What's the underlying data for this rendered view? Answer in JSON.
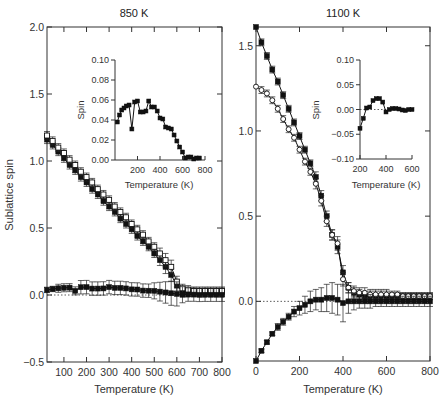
{
  "chart_data": [
    {
      "type": "line",
      "panel": "left",
      "title": "850 K",
      "xlabel": "Temperature (K)",
      "ylabel": "Sublattice spin",
      "xlim": [
        25,
        800
      ],
      "ylim": [
        -0.5,
        2.0
      ],
      "xticks": [
        100,
        200,
        300,
        400,
        500,
        600,
        700,
        800
      ],
      "yticks": [
        -0.5,
        0.0,
        0.5,
        1.0,
        1.5,
        2.0
      ],
      "ytick_labels": [
        "−0.5",
        "0.0",
        "0.5",
        "1.0",
        "1.5",
        "2.0"
      ],
      "grid": false,
      "zero_dotted_line": true,
      "series": [
        {
          "name": "sublattice A (filled)",
          "marker": "filled-square",
          "x": [
            25,
            50,
            75,
            100,
            125,
            150,
            175,
            200,
            225,
            250,
            275,
            300,
            325,
            350,
            375,
            400,
            425,
            450,
            475,
            500,
            525,
            550,
            575,
            600,
            625,
            650,
            675,
            700,
            725,
            750,
            775,
            800
          ],
          "y": [
            1.16,
            1.12,
            1.07,
            1.02,
            0.97,
            0.93,
            0.88,
            0.84,
            0.79,
            0.75,
            0.7,
            0.66,
            0.62,
            0.57,
            0.53,
            0.49,
            0.44,
            0.4,
            0.36,
            0.31,
            0.26,
            0.21,
            0.15,
            0.07,
            0.03,
            0.02,
            0.02,
            0.02,
            0.02,
            0.02,
            0.02,
            0.02
          ],
          "err": [
            0.03,
            0.03,
            0.03,
            0.03,
            0.03,
            0.03,
            0.03,
            0.03,
            0.03,
            0.03,
            0.03,
            0.03,
            0.03,
            0.03,
            0.03,
            0.03,
            0.03,
            0.03,
            0.03,
            0.03,
            0.04,
            0.05,
            0.05,
            0.04,
            0.03,
            0.03,
            0.03,
            0.03,
            0.03,
            0.03,
            0.03,
            0.03
          ]
        },
        {
          "name": "sublattice B (open)",
          "marker": "open-square",
          "x": [
            25,
            50,
            75,
            100,
            125,
            150,
            175,
            200,
            225,
            250,
            275,
            300,
            325,
            350,
            375,
            400,
            425,
            450,
            475,
            500,
            525,
            550,
            575,
            600,
            625,
            650,
            675,
            700,
            725,
            750,
            775,
            800
          ],
          "y": [
            1.19,
            1.15,
            1.1,
            1.06,
            1.01,
            0.97,
            0.92,
            0.88,
            0.84,
            0.79,
            0.75,
            0.71,
            0.66,
            0.62,
            0.58,
            0.53,
            0.49,
            0.45,
            0.4,
            0.36,
            0.31,
            0.26,
            0.21,
            0.1,
            0.05,
            0.04,
            0.03,
            0.03,
            0.03,
            0.03,
            0.03,
            0.03
          ],
          "err": [
            0.03,
            0.03,
            0.03,
            0.03,
            0.03,
            0.03,
            0.03,
            0.03,
            0.03,
            0.03,
            0.03,
            0.03,
            0.03,
            0.03,
            0.03,
            0.03,
            0.03,
            0.03,
            0.03,
            0.03,
            0.04,
            0.05,
            0.05,
            0.04,
            0.03,
            0.03,
            0.03,
            0.03,
            0.03,
            0.03,
            0.03,
            0.03
          ]
        },
        {
          "name": "net spin (filled)",
          "marker": "filled-square",
          "x": [
            25,
            50,
            75,
            100,
            125,
            150,
            175,
            200,
            225,
            250,
            275,
            300,
            325,
            350,
            375,
            400,
            425,
            450,
            475,
            500,
            525,
            550,
            575,
            600,
            625,
            650,
            675,
            700,
            725,
            750,
            775,
            800
          ],
          "y": [
            0.038,
            0.045,
            0.05,
            0.054,
            0.055,
            0.031,
            0.058,
            0.059,
            0.048,
            0.048,
            0.049,
            0.059,
            0.053,
            0.053,
            0.049,
            0.042,
            0.041,
            0.033,
            0.032,
            0.031,
            0.025,
            0.019,
            0.013,
            0.008,
            0.002,
            0.003,
            0.003,
            0.001,
            0.002,
            0.002,
            0.002,
            0.002
          ],
          "err": [
            0.02,
            0.02,
            0.03,
            0.03,
            0.03,
            0.03,
            0.05,
            0.05,
            0.05,
            0.05,
            0.05,
            0.05,
            0.05,
            0.05,
            0.05,
            0.05,
            0.05,
            0.05,
            0.05,
            0.06,
            0.07,
            0.08,
            0.09,
            0.09,
            0.06,
            0.05,
            0.05,
            0.05,
            0.05,
            0.05,
            0.05,
            0.05
          ]
        }
      ],
      "inset": {
        "xlabel": "Temperature (K)",
        "ylabel": "Spin",
        "xlim": [
          0,
          800
        ],
        "ylim": [
          0.0,
          0.1
        ],
        "xticks": [
          200,
          400,
          600,
          800
        ],
        "yticks": [
          0.0,
          0.02,
          0.04,
          0.06,
          0.08,
          0.1
        ],
        "ytick_labels": [
          "0.00",
          "0.02",
          "0.04",
          "0.06",
          "0.08",
          "0.10"
        ],
        "x": [
          20,
          40,
          60,
          80,
          100,
          125,
          150,
          175,
          200,
          225,
          250,
          275,
          300,
          325,
          350,
          375,
          400,
          425,
          450,
          475,
          500,
          525,
          550,
          575,
          600,
          625,
          650,
          675,
          700,
          725,
          750
        ],
        "y": [
          0.038,
          0.045,
          0.05,
          0.052,
          0.054,
          0.055,
          0.031,
          0.058,
          0.059,
          0.048,
          0.048,
          0.049,
          0.059,
          0.053,
          0.053,
          0.049,
          0.042,
          0.041,
          0.033,
          0.032,
          0.031,
          0.025,
          0.019,
          0.013,
          0.008,
          0.002,
          0.003,
          0.003,
          0.001,
          0.002,
          0.002
        ]
      }
    },
    {
      "type": "line",
      "panel": "right",
      "title": "1100 K",
      "xlabel": "Temperature (K)",
      "ylabel": "",
      "xlim": [
        0,
        800
      ],
      "ylim": [
        -0.35,
        1.61
      ],
      "xticks": [
        0,
        200,
        400,
        600,
        800
      ],
      "yticks": [
        0.0,
        0.5,
        1.0,
        1.5
      ],
      "ytick_labels": [
        "0.0",
        "0.5",
        "1.0",
        "1.5"
      ],
      "grid": false,
      "zero_dotted_line": true,
      "series": [
        {
          "name": "sublattice A (filled)",
          "marker": "filled-square",
          "x": [
            0,
            25,
            50,
            75,
            100,
            125,
            150,
            175,
            200,
            225,
            250,
            275,
            300,
            325,
            350,
            375,
            400,
            425,
            450,
            475,
            500,
            525,
            550,
            575,
            600,
            625,
            650,
            675,
            700,
            725,
            750,
            775,
            800
          ],
          "y": [
            1.61,
            1.52,
            1.44,
            1.36,
            1.29,
            1.21,
            1.13,
            1.05,
            0.97,
            0.89,
            0.81,
            0.73,
            0.62,
            0.5,
            0.39,
            0.32,
            0.17,
            0.08,
            0.05,
            0.04,
            0.03,
            0.03,
            0.03,
            0.03,
            0.03,
            0.03,
            0.03,
            0.03,
            0.03,
            0.03,
            0.03,
            0.03,
            0.03
          ],
          "err": [
            0,
            0.02,
            0.02,
            0.02,
            0.02,
            0.02,
            0.02,
            0.02,
            0.02,
            0.02,
            0.02,
            0.03,
            0.03,
            0.03,
            0.03,
            0.04,
            0.04,
            0.03,
            0.03,
            0.03,
            0.03,
            0.03,
            0.03,
            0.03,
            0.03,
            0.02,
            0.02,
            0.02,
            0.02,
            0.02,
            0.02,
            0.02,
            0.02
          ]
        },
        {
          "name": "sublattice B (open)",
          "marker": "open-circle",
          "x": [
            0,
            25,
            50,
            75,
            100,
            125,
            150,
            175,
            200,
            225,
            250,
            275,
            300,
            325,
            350,
            375,
            400,
            425,
            450,
            475,
            500,
            525,
            550,
            575,
            600,
            625,
            650,
            675,
            700,
            725,
            750,
            775,
            800
          ],
          "y": [
            1.26,
            1.24,
            1.22,
            1.18,
            1.13,
            1.07,
            1.01,
            0.96,
            0.89,
            0.82,
            0.76,
            0.69,
            0.59,
            0.47,
            0.39,
            0.34,
            0.13,
            0.08,
            0.06,
            0.05,
            0.05,
            0.04,
            0.04,
            0.04,
            0.04,
            0.04,
            0.04,
            0.03,
            0.03,
            0.03,
            0.03,
            0.03,
            0.03
          ],
          "err": [
            0,
            0.02,
            0.02,
            0.02,
            0.02,
            0.02,
            0.02,
            0.02,
            0.02,
            0.02,
            0.02,
            0.03,
            0.03,
            0.03,
            0.03,
            0.04,
            0.04,
            0.03,
            0.03,
            0.03,
            0.03,
            0.03,
            0.03,
            0.03,
            0.03,
            0.02,
            0.02,
            0.02,
            0.02,
            0.02,
            0.02,
            0.02,
            0.02
          ]
        },
        {
          "name": "net spin (filled)",
          "marker": "filled-square",
          "x": [
            0,
            25,
            50,
            75,
            100,
            125,
            150,
            175,
            200,
            225,
            250,
            275,
            300,
            325,
            350,
            375,
            400,
            425,
            450,
            475,
            500,
            525,
            550,
            575,
            600,
            625,
            650,
            675,
            700,
            725,
            750,
            775,
            800
          ],
          "y": [
            -0.35,
            -0.29,
            -0.24,
            -0.19,
            -0.15,
            -0.12,
            -0.09,
            -0.06,
            -0.04,
            -0.02,
            0.0,
            0.01,
            0.01,
            0.02,
            0.02,
            0.01,
            -0.01,
            0.0,
            0.0,
            0.0,
            0.0,
            0.0,
            0.0,
            0.0,
            0.0,
            0.0,
            0.0,
            0.0,
            0.0,
            0.0,
            0.0,
            0.0,
            0.0
          ],
          "err": [
            0,
            0.01,
            0.01,
            0.01,
            0.02,
            0.02,
            0.02,
            0.03,
            0.04,
            0.05,
            0.06,
            0.06,
            0.07,
            0.08,
            0.09,
            0.09,
            0.11,
            0.07,
            0.05,
            0.04,
            0.04,
            0.04,
            0.03,
            0.03,
            0.03,
            0.03,
            0.03,
            0.03,
            0.03,
            0.03,
            0.03,
            0.03,
            0.03
          ]
        }
      ],
      "inset": {
        "xlabel": "Temperature (K)",
        "ylabel": "Spin",
        "xlim": [
          200,
          600
        ],
        "ylim": [
          -0.1,
          0.1
        ],
        "xticks": [
          200,
          400,
          600
        ],
        "yticks": [
          -0.1,
          -0.05,
          0.0,
          0.05,
          0.1
        ],
        "ytick_labels": [
          "−0.10",
          "−0.05",
          "0.00",
          "0.05",
          "0.10"
        ],
        "zero_dotted_line": true,
        "x": [
          200,
          225,
          250,
          275,
          300,
          325,
          350,
          375,
          400,
          425,
          450,
          475,
          500,
          525,
          550,
          575,
          600
        ],
        "y": [
          -0.038,
          -0.018,
          0.003,
          0.005,
          0.018,
          0.022,
          0.022,
          0.015,
          -0.005,
          0.0,
          0.002,
          0.002,
          0.001,
          -0.001,
          -0.002,
          0.0,
          0.0
        ]
      }
    }
  ],
  "panels": {
    "left": {
      "title": "850 K",
      "xlabel": "Temperature (K)",
      "ylabel": "Sublattice spin",
      "inset_xlabel": "Temperature (K)",
      "inset_ylabel": "Spin"
    },
    "right": {
      "title": "1100 K",
      "xlabel": "Temperature (K)",
      "inset_xlabel": "Temperature (K)",
      "inset_ylabel": "Spin"
    }
  },
  "colors": {
    "ink": "#111111",
    "axis": "#333333",
    "background": "#ffffff"
  }
}
